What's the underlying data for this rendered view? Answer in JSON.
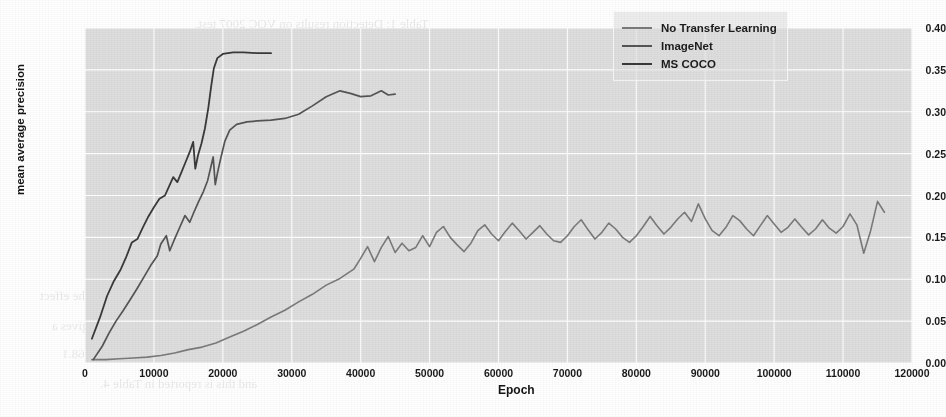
{
  "figure": {
    "background_color": "#ffffff",
    "plot_background_color": "#dedede",
    "grid_color": "#ffffff"
  },
  "bleedthrough": [
    {
      "text": "Table 1: Detection results on VOC 2007 test.",
      "x": 195,
      "y": 16,
      "size": 13
    },
    {
      "text": "Method    mAP    aero  bike  bird  boat",
      "x": 280,
      "y": 78,
      "size": 13
    },
    {
      "text": "VGG16     66.9   74.5   78.3   69.2   53.2",
      "x": 268,
      "y": 116,
      "size": 13
    },
    {
      "text": "ZF        59.2   64.1   69.7   50.4   41.1",
      "x": 275,
      "y": 152,
      "size": 13
    },
    {
      "text": "SSD300    68.0   73.4   77.5   64.1   59.0",
      "x": 270,
      "y": 186,
      "size": 13
    },
    {
      "text": "Impact of Adding New Examples. The remaining rows show the effect",
      "x": 40,
      "y": 288,
      "size": 13
    },
    {
      "text": "of training new images as training set is increased, and that gives a",
      "x": 52,
      "y": 318,
      "size": 13
    },
    {
      "text": "the additional 2010 data. Performance improves from 65.9 to 68.1",
      "x": 62,
      "y": 346,
      "size": 13
    },
    {
      "text": "and this is reported in Table 4.",
      "x": 100,
      "y": 376,
      "size": 13
    }
  ],
  "chart_data": {
    "type": "line",
    "title": "",
    "xlabel": "Epoch",
    "ylabel": "mean average precision",
    "xlim": [
      0,
      120000
    ],
    "ylim": [
      0.0,
      0.4
    ],
    "xticks": [
      0,
      10000,
      20000,
      30000,
      40000,
      50000,
      60000,
      70000,
      80000,
      90000,
      100000,
      110000,
      120000
    ],
    "xticklabels": [
      "0",
      "10000",
      "20000",
      "30000",
      "40000",
      "50000",
      "60000",
      "70000",
      "80000",
      "90000",
      "100000",
      "110000",
      "120000"
    ],
    "yticks": [
      0.0,
      0.05,
      0.1,
      0.15,
      0.2,
      0.25,
      0.3,
      0.35,
      0.4
    ],
    "yticklabels": [
      "0.00",
      "0.05",
      "0.10",
      "0.15",
      "0.20",
      "0.25",
      "0.30",
      "0.35",
      "0.40"
    ],
    "grid": true,
    "legend_position": "upper right",
    "series": [
      {
        "name": "No Transfer Learning",
        "color": "#7a7a7a",
        "linewidth": 1.6,
        "points": [
          [
            1000,
            0.004
          ],
          [
            3000,
            0.004
          ],
          [
            5000,
            0.005
          ],
          [
            7000,
            0.006
          ],
          [
            9000,
            0.007
          ],
          [
            11000,
            0.009
          ],
          [
            13000,
            0.012
          ],
          [
            15000,
            0.016
          ],
          [
            17000,
            0.019
          ],
          [
            19000,
            0.024
          ],
          [
            21000,
            0.031
          ],
          [
            23000,
            0.038
          ],
          [
            25000,
            0.046
          ],
          [
            27000,
            0.055
          ],
          [
            29000,
            0.063
          ],
          [
            31000,
            0.073
          ],
          [
            33000,
            0.082
          ],
          [
            35000,
            0.093
          ],
          [
            37000,
            0.101
          ],
          [
            39000,
            0.112
          ],
          [
            40000,
            0.125
          ],
          [
            41000,
            0.139
          ],
          [
            42000,
            0.121
          ],
          [
            43000,
            0.138
          ],
          [
            44000,
            0.151
          ],
          [
            45000,
            0.132
          ],
          [
            46000,
            0.143
          ],
          [
            47000,
            0.134
          ],
          [
            48000,
            0.138
          ],
          [
            49000,
            0.152
          ],
          [
            50000,
            0.139
          ],
          [
            51000,
            0.156
          ],
          [
            52000,
            0.163
          ],
          [
            53000,
            0.15
          ],
          [
            54000,
            0.141
          ],
          [
            55000,
            0.133
          ],
          [
            56000,
            0.143
          ],
          [
            57000,
            0.158
          ],
          [
            58000,
            0.165
          ],
          [
            59000,
            0.154
          ],
          [
            60000,
            0.146
          ],
          [
            61000,
            0.157
          ],
          [
            62000,
            0.167
          ],
          [
            63000,
            0.158
          ],
          [
            64000,
            0.148
          ],
          [
            65000,
            0.156
          ],
          [
            66000,
            0.164
          ],
          [
            67000,
            0.154
          ],
          [
            68000,
            0.146
          ],
          [
            69000,
            0.144
          ],
          [
            70000,
            0.152
          ],
          [
            71000,
            0.163
          ],
          [
            72000,
            0.171
          ],
          [
            73000,
            0.159
          ],
          [
            74000,
            0.148
          ],
          [
            75000,
            0.156
          ],
          [
            76000,
            0.167
          ],
          [
            77000,
            0.16
          ],
          [
            78000,
            0.15
          ],
          [
            79000,
            0.144
          ],
          [
            80000,
            0.152
          ],
          [
            81000,
            0.163
          ],
          [
            82000,
            0.175
          ],
          [
            83000,
            0.164
          ],
          [
            84000,
            0.154
          ],
          [
            85000,
            0.162
          ],
          [
            86000,
            0.172
          ],
          [
            87000,
            0.18
          ],
          [
            88000,
            0.169
          ],
          [
            89000,
            0.19
          ],
          [
            90000,
            0.172
          ],
          [
            91000,
            0.158
          ],
          [
            92000,
            0.152
          ],
          [
            93000,
            0.162
          ],
          [
            94000,
            0.176
          ],
          [
            95000,
            0.17
          ],
          [
            96000,
            0.16
          ],
          [
            97000,
            0.152
          ],
          [
            98000,
            0.164
          ],
          [
            99000,
            0.176
          ],
          [
            100000,
            0.166
          ],
          [
            101000,
            0.156
          ],
          [
            102000,
            0.162
          ],
          [
            103000,
            0.172
          ],
          [
            104000,
            0.162
          ],
          [
            105000,
            0.153
          ],
          [
            106000,
            0.16
          ],
          [
            107000,
            0.171
          ],
          [
            108000,
            0.161
          ],
          [
            109000,
            0.155
          ],
          [
            110000,
            0.163
          ],
          [
            111000,
            0.178
          ],
          [
            112000,
            0.165
          ],
          [
            113000,
            0.131
          ],
          [
            114000,
            0.158
          ],
          [
            115000,
            0.193
          ],
          [
            116000,
            0.18
          ]
        ]
      },
      {
        "name": "ImageNet",
        "color": "#555555",
        "linewidth": 1.7,
        "points": [
          [
            1200,
            0.004
          ],
          [
            2500,
            0.02
          ],
          [
            3500,
            0.036
          ],
          [
            4500,
            0.05
          ],
          [
            5500,
            0.062
          ],
          [
            6500,
            0.075
          ],
          [
            7500,
            0.088
          ],
          [
            8500,
            0.102
          ],
          [
            9500,
            0.116
          ],
          [
            10500,
            0.128
          ],
          [
            11000,
            0.142
          ],
          [
            11800,
            0.152
          ],
          [
            12300,
            0.134
          ],
          [
            13000,
            0.148
          ],
          [
            13800,
            0.163
          ],
          [
            14500,
            0.176
          ],
          [
            15200,
            0.168
          ],
          [
            15800,
            0.18
          ],
          [
            16500,
            0.193
          ],
          [
            17200,
            0.205
          ],
          [
            17800,
            0.218
          ],
          [
            18200,
            0.232
          ],
          [
            18600,
            0.246
          ],
          [
            18900,
            0.213
          ],
          [
            19300,
            0.23
          ],
          [
            19800,
            0.248
          ],
          [
            20300,
            0.265
          ],
          [
            21000,
            0.278
          ],
          [
            22000,
            0.285
          ],
          [
            23500,
            0.288
          ],
          [
            25000,
            0.289
          ],
          [
            27000,
            0.29
          ],
          [
            29000,
            0.292
          ],
          [
            31000,
            0.297
          ],
          [
            33000,
            0.307
          ],
          [
            35000,
            0.318
          ],
          [
            37000,
            0.325
          ],
          [
            38500,
            0.322
          ],
          [
            40000,
            0.318
          ],
          [
            41500,
            0.319
          ],
          [
            43000,
            0.325
          ],
          [
            44000,
            0.32
          ],
          [
            45000,
            0.321
          ]
        ]
      },
      {
        "name": "MS COCO",
        "color": "#3a3a3a",
        "linewidth": 1.8,
        "points": [
          [
            1000,
            0.029
          ],
          [
            2200,
            0.055
          ],
          [
            3200,
            0.08
          ],
          [
            4200,
            0.098
          ],
          [
            5200,
            0.112
          ],
          [
            6000,
            0.127
          ],
          [
            6800,
            0.144
          ],
          [
            7600,
            0.148
          ],
          [
            8400,
            0.162
          ],
          [
            9200,
            0.175
          ],
          [
            10000,
            0.186
          ],
          [
            10800,
            0.196
          ],
          [
            11600,
            0.2
          ],
          [
            12200,
            0.211
          ],
          [
            12800,
            0.222
          ],
          [
            13400,
            0.216
          ],
          [
            14000,
            0.228
          ],
          [
            14600,
            0.24
          ],
          [
            15200,
            0.252
          ],
          [
            15700,
            0.264
          ],
          [
            16000,
            0.232
          ],
          [
            16400,
            0.248
          ],
          [
            16900,
            0.262
          ],
          [
            17400,
            0.28
          ],
          [
            17900,
            0.305
          ],
          [
            18300,
            0.33
          ],
          [
            18700,
            0.352
          ],
          [
            19200,
            0.364
          ],
          [
            20000,
            0.369
          ],
          [
            21500,
            0.371
          ],
          [
            23000,
            0.371
          ],
          [
            25000,
            0.37
          ],
          [
            27000,
            0.37
          ]
        ]
      }
    ]
  },
  "legend": {
    "entries": [
      {
        "label": "No Transfer Learning",
        "color": "#7a7a7a"
      },
      {
        "label": "ImageNet",
        "color": "#555555"
      },
      {
        "label": "MS COCO",
        "color": "#3a3a3a"
      }
    ]
  }
}
